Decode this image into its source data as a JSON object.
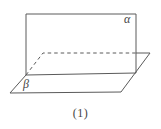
{
  "diagram": {
    "caption": "(1)",
    "labels": {
      "alpha": "α",
      "beta": "β"
    },
    "line_color": "#5a5a5a",
    "background_color": "#ffffff"
  }
}
